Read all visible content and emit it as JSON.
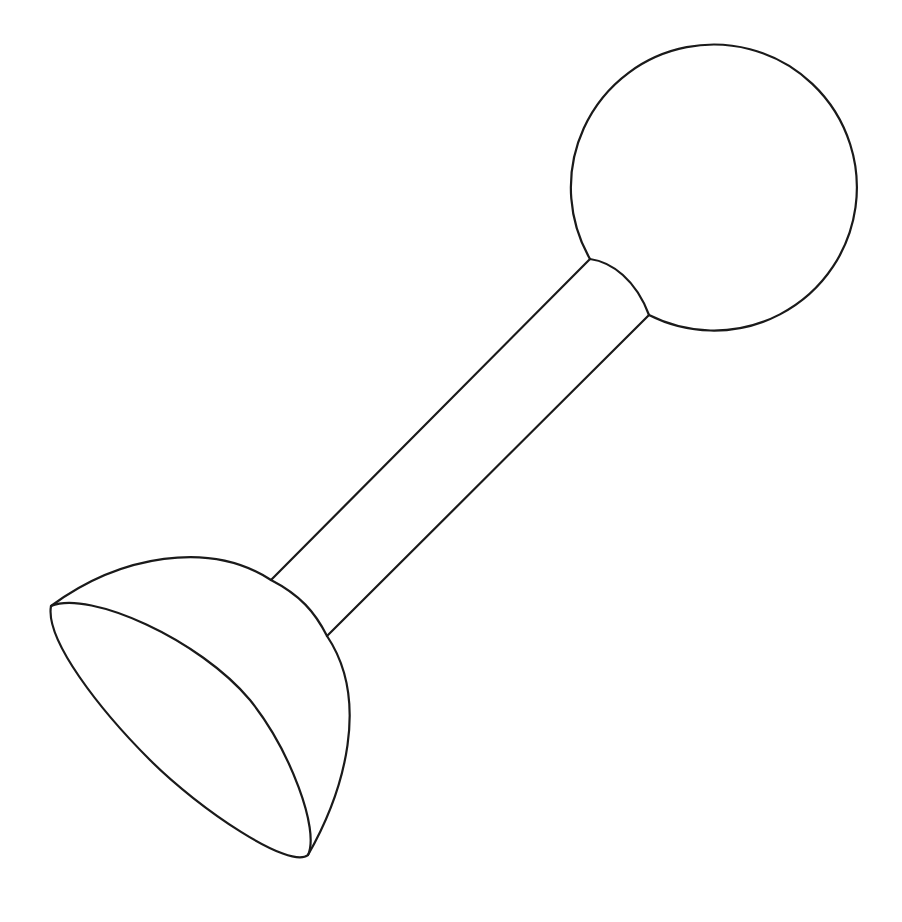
{
  "figure": {
    "parts": [
      "sphere",
      "rod",
      "hemisphere"
    ],
    "colors": {
      "stroke": "#1a1a1a",
      "background": "#ffffff"
    }
  }
}
